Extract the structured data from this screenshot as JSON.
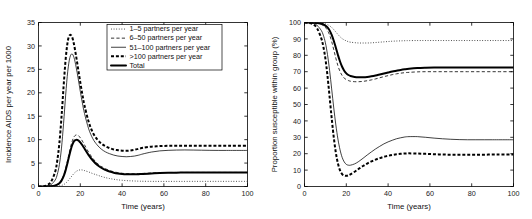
{
  "figure": {
    "panels": [
      {
        "id": "left",
        "xlabel": "Time (years)",
        "ylabel": "Incidence AIDS per year per 1000",
        "xticks": [
          0,
          20,
          40,
          60,
          80,
          100
        ],
        "yticks": [
          0,
          5,
          10,
          15,
          20,
          25,
          30,
          35
        ],
        "has_legend": true
      },
      {
        "id": "right",
        "xlabel": "Time (years)",
        "ylabel": "Proportion susceptible within group (%)",
        "xticks": [
          0,
          20,
          40,
          60,
          80,
          100
        ],
        "yticks": [
          0,
          10,
          20,
          30,
          40,
          50,
          60,
          70,
          80,
          90,
          100
        ],
        "has_legend": false
      }
    ],
    "legend": {
      "entries": [
        {
          "label": "1–5 partners per year",
          "style": "dotted"
        },
        {
          "label": "6–50 partners per year",
          "style": "dashed"
        },
        {
          "label": "51–100 partners per year",
          "style": "solid"
        },
        {
          "label": ">100 partners per year",
          "style": "thick-dashed"
        },
        {
          "label": "Total",
          "style": "thick-solid"
        }
      ]
    }
  },
  "chart_data": [
    {
      "type": "line",
      "panel": "left",
      "title": "",
      "xlabel": "Time (years)",
      "ylabel": "Incidence AIDS per year per 1000",
      "xlim": [
        0,
        100
      ],
      "ylim": [
        0,
        35
      ],
      "xticks": [
        0,
        20,
        40,
        60,
        80,
        100
      ],
      "yticks": [
        0,
        5,
        10,
        15,
        20,
        25,
        30,
        35
      ],
      "grid": false,
      "legend_position": "upper-right-inside",
      "x": [
        0,
        2,
        4,
        6,
        8,
        9,
        10,
        11,
        12,
        13,
        14,
        15,
        16,
        17,
        18,
        19,
        20,
        21,
        22,
        24,
        26,
        28,
        30,
        32,
        34,
        36,
        38,
        40,
        42,
        44,
        46,
        48,
        50,
        54,
        58,
        62,
        66,
        70,
        74,
        78,
        82,
        86,
        90,
        94,
        100
      ],
      "series": [
        {
          "name": "1–5 partners per year",
          "style": "dotted",
          "values": [
            0,
            0,
            0,
            0.02,
            0.05,
            0.08,
            0.13,
            0.22,
            0.4,
            0.7,
            1.15,
            1.7,
            2.25,
            2.8,
            3.2,
            3.45,
            3.55,
            3.52,
            3.4,
            3.1,
            2.75,
            2.45,
            2.15,
            1.9,
            1.7,
            1.55,
            1.42,
            1.33,
            1.26,
            1.21,
            1.17,
            1.14,
            1.12,
            1.1,
            1.09,
            1.09,
            1.09,
            1.09,
            1.1,
            1.1,
            1.1,
            1.1,
            1.1,
            1.1,
            1.1
          ]
        },
        {
          "name": "6–50 partners per year",
          "style": "dashed",
          "values": [
            0,
            0,
            0.02,
            0.08,
            0.25,
            0.45,
            0.8,
            1.4,
            2.4,
            3.9,
            5.8,
            7.8,
            9.5,
            10.6,
            11.0,
            10.9,
            10.4,
            9.7,
            8.9,
            7.3,
            6.0,
            5.0,
            4.3,
            3.8,
            3.4,
            3.15,
            2.95,
            2.82,
            2.75,
            2.72,
            2.72,
            2.75,
            2.8,
            2.88,
            2.95,
            2.99,
            3.0,
            3.0,
            3.0,
            3.0,
            3.0,
            3.0,
            3.0,
            3.0,
            3.0
          ]
        },
        {
          "name": "51–100 partners per year",
          "style": "solid",
          "values": [
            0,
            0.02,
            0.1,
            0.4,
            1.4,
            2.6,
            4.7,
            8.2,
            13.5,
            19.5,
            24.6,
            27.5,
            28.3,
            27.5,
            25.5,
            23.0,
            20.3,
            17.8,
            15.6,
            12.3,
            10.2,
            8.9,
            8.0,
            7.4,
            7.0,
            6.7,
            6.5,
            6.4,
            6.35,
            6.4,
            6.5,
            6.7,
            6.95,
            7.35,
            7.6,
            7.72,
            7.78,
            7.8,
            7.78,
            7.75,
            7.72,
            7.7,
            7.7,
            7.7,
            7.7
          ]
        },
        {
          "name": ">100 partners per year",
          "style": "thick-dashed",
          "values": [
            0,
            0.05,
            0.25,
            1.0,
            3.2,
            5.6,
            9.3,
            14.8,
            21.3,
            27.2,
            31.0,
            32.3,
            32.0,
            30.3,
            27.8,
            25.0,
            22.2,
            19.6,
            17.3,
            13.8,
            11.5,
            10.1,
            9.2,
            8.6,
            8.2,
            7.9,
            7.75,
            7.65,
            7.62,
            7.7,
            7.85,
            8.05,
            8.25,
            8.5,
            8.62,
            8.68,
            8.7,
            8.7,
            8.7,
            8.7,
            8.7,
            8.7,
            8.7,
            8.7,
            8.7
          ]
        },
        {
          "name": "Total",
          "style": "thick-solid",
          "values": [
            0,
            0,
            0.02,
            0.07,
            0.22,
            0.4,
            0.7,
            1.25,
            2.15,
            3.5,
            5.25,
            7.1,
            8.7,
            9.7,
            9.95,
            9.85,
            9.4,
            8.8,
            8.1,
            6.7,
            5.55,
            4.65,
            4.0,
            3.55,
            3.2,
            2.95,
            2.78,
            2.68,
            2.62,
            2.6,
            2.6,
            2.63,
            2.68,
            2.78,
            2.88,
            2.93,
            2.96,
            2.97,
            2.98,
            2.98,
            2.98,
            2.98,
            2.98,
            2.98,
            2.98
          ]
        }
      ]
    },
    {
      "type": "line",
      "panel": "right",
      "title": "",
      "xlabel": "Time (years)",
      "ylabel": "Proportion susceptible within group (%)",
      "xlim": [
        0,
        100
      ],
      "ylim": [
        0,
        100
      ],
      "xticks": [
        0,
        20,
        40,
        60,
        80,
        100
      ],
      "yticks": [
        0,
        10,
        20,
        30,
        40,
        50,
        60,
        70,
        80,
        90,
        100
      ],
      "grid": false,
      "legend_position": "none",
      "x": [
        0,
        2,
        4,
        6,
        8,
        9,
        10,
        11,
        12,
        13,
        14,
        15,
        16,
        17,
        18,
        19,
        20,
        21,
        22,
        24,
        26,
        28,
        30,
        32,
        34,
        36,
        38,
        40,
        42,
        44,
        46,
        48,
        50,
        54,
        58,
        62,
        66,
        70,
        74,
        78,
        82,
        86,
        90,
        94,
        100
      ],
      "series": [
        {
          "name": "1–5 partners per year",
          "style": "dotted",
          "values": [
            100,
            100,
            100,
            99.9,
            99.7,
            99.5,
            99.2,
            98.7,
            98.0,
            97.0,
            95.7,
            94.2,
            92.7,
            91.3,
            90.2,
            89.4,
            88.8,
            88.3,
            88.0,
            87.7,
            87.5,
            87.5,
            87.5,
            87.6,
            87.8,
            88.0,
            88.2,
            88.4,
            88.6,
            88.7,
            88.8,
            88.9,
            88.95,
            89.0,
            89.0,
            89.0,
            89.0,
            89.0,
            89.0,
            89.0,
            89.0,
            89.0,
            89.0,
            89.0,
            89.0
          ]
        },
        {
          "name": "6–50 partners per year",
          "style": "dashed",
          "values": [
            100,
            100,
            99.9,
            99.6,
            98.8,
            98.1,
            97.0,
            95.2,
            92.4,
            88.4,
            83.4,
            78.2,
            73.6,
            70.1,
            67.7,
            66.1,
            65.2,
            64.6,
            64.2,
            63.9,
            63.9,
            64.1,
            64.5,
            65.0,
            65.6,
            66.3,
            67.0,
            67.6,
            68.2,
            68.7,
            69.1,
            69.4,
            69.6,
            69.9,
            70.0,
            70.0,
            70.0,
            70.0,
            70.0,
            70.0,
            70.0,
            70.0,
            70.0,
            70.0,
            70.0
          ]
        },
        {
          "name": "51–100 partners per year",
          "style": "solid",
          "values": [
            100,
            99.9,
            99.5,
            98.3,
            95.2,
            92.3,
            87.6,
            80.5,
            70.8,
            59.5,
            47.9,
            37.5,
            28.9,
            22.4,
            17.8,
            15.0,
            13.5,
            13.0,
            13.0,
            13.8,
            15.3,
            17.2,
            19.2,
            21.1,
            22.9,
            24.5,
            26.0,
            27.2,
            28.2,
            29.1,
            29.7,
            30.2,
            30.4,
            30.4,
            30.0,
            29.5,
            29.1,
            28.8,
            28.6,
            28.5,
            28.5,
            28.5,
            28.5,
            28.5,
            28.5
          ]
        },
        {
          "name": ">100 partners per year",
          "style": "thick-dashed",
          "values": [
            100,
            99.8,
            99.0,
            96.5,
            90.5,
            85.4,
            78.0,
            67.5,
            54.8,
            41.8,
            30.0,
            20.6,
            14.0,
            9.8,
            7.6,
            6.7,
            6.5,
            6.8,
            7.4,
            9.0,
            10.8,
            12.5,
            14.0,
            15.3,
            16.4,
            17.3,
            18.1,
            18.7,
            19.2,
            19.6,
            19.9,
            20.1,
            20.2,
            20.1,
            19.9,
            19.7,
            19.5,
            19.4,
            19.4,
            19.4,
            19.4,
            19.4,
            19.5,
            19.5,
            19.5
          ]
        },
        {
          "name": "Total",
          "style": "thick-solid",
          "values": [
            100,
            100,
            99.9,
            99.7,
            99.2,
            98.8,
            98.1,
            97.0,
            95.2,
            92.5,
            88.9,
            84.6,
            80.2,
            76.2,
            73.0,
            70.6,
            69.0,
            68.0,
            67.4,
            66.8,
            66.6,
            66.6,
            66.8,
            67.2,
            67.7,
            68.3,
            68.9,
            69.5,
            70.1,
            70.6,
            71.1,
            71.5,
            71.8,
            72.2,
            72.4,
            72.5,
            72.5,
            72.5,
            72.5,
            72.5,
            72.5,
            72.5,
            72.5,
            72.5,
            72.5
          ]
        }
      ]
    }
  ]
}
